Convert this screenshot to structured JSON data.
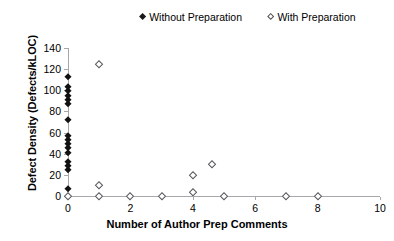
{
  "chart_data": {
    "type": "scatter",
    "title": "",
    "xlabel": "Number of Author Prep Comments",
    "ylabel": "Defect Density (Defects/kLOC)",
    "xlim": [
      0,
      10
    ],
    "ylim": [
      0,
      140
    ],
    "xticks": [
      0,
      2,
      4,
      6,
      8,
      10
    ],
    "xtick_labels": [
      "0",
      "2",
      "4",
      "6",
      "8",
      "10"
    ],
    "yticks": [
      0,
      20,
      40,
      60,
      80,
      100,
      120,
      140
    ],
    "ytick_labels": [
      "0",
      "20",
      "40",
      "60",
      "80",
      "100",
      "120",
      "140"
    ],
    "grid": false,
    "legend_position": "top-center",
    "series": [
      {
        "name": "Without Preparation",
        "marker": "filled-diamond",
        "color": "#111111",
        "points": [
          {
            "x": 0,
            "y": 113
          },
          {
            "x": 0,
            "y": 103
          },
          {
            "x": 0,
            "y": 99
          },
          {
            "x": 0,
            "y": 95
          },
          {
            "x": 0,
            "y": 91
          },
          {
            "x": 0,
            "y": 87
          },
          {
            "x": 0,
            "y": 72
          },
          {
            "x": 0,
            "y": 57
          },
          {
            "x": 0,
            "y": 53
          },
          {
            "x": 0,
            "y": 49
          },
          {
            "x": 0,
            "y": 45
          },
          {
            "x": 0,
            "y": 41
          },
          {
            "x": 0,
            "y": 32
          },
          {
            "x": 0,
            "y": 28
          },
          {
            "x": 0,
            "y": 25
          },
          {
            "x": 0,
            "y": 7
          }
        ]
      },
      {
        "name": "With Preparation",
        "marker": "open-diamond",
        "color": "#55555d",
        "points": [
          {
            "x": 1,
            "y": 125
          },
          {
            "x": 4.6,
            "y": 30
          },
          {
            "x": 4,
            "y": 20
          },
          {
            "x": 1,
            "y": 10
          },
          {
            "x": 4,
            "y": 4
          },
          {
            "x": 0,
            "y": 0
          },
          {
            "x": 1,
            "y": 0
          },
          {
            "x": 2,
            "y": 0
          },
          {
            "x": 3,
            "y": 0
          },
          {
            "x": 5,
            "y": 0
          },
          {
            "x": 7,
            "y": 0
          },
          {
            "x": 8,
            "y": 0
          }
        ]
      }
    ]
  },
  "legend": {
    "entries": [
      {
        "label": "Without Preparation",
        "marker": "filled-diamond"
      },
      {
        "label": "With Preparation",
        "marker": "open-diamond"
      }
    ]
  }
}
